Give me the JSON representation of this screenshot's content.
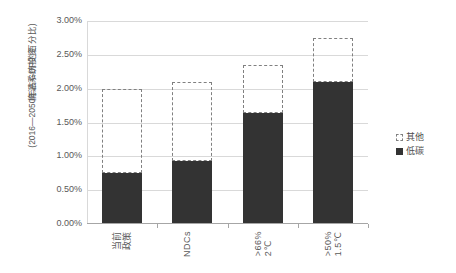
{
  "chart_data": {
    "type": "bar",
    "title": "",
    "subtitle": "",
    "xlabel": "",
    "ylabel_line1": "能源系统投资",
    "ylabel_line2": "(2016—2050年占GDP的百分比)",
    "categories": [
      "当前政策",
      "NDCs",
      ">66% 2℃",
      ">50% 1.5℃"
    ],
    "category_lines": [
      [
        "当前",
        "政策"
      ],
      [
        "NDCs"
      ],
      [
        ">66%",
        "2℃"
      ],
      [
        ">50%",
        "1.5℃"
      ]
    ],
    "series": [
      {
        "name": "低碳",
        "style": "solid",
        "color": "#333333",
        "values": [
          0.75,
          0.93,
          1.64,
          2.1
        ]
      },
      {
        "name": "其他",
        "style": "dashed",
        "color": "#808080",
        "values": [
          2.0,
          2.1,
          2.35,
          2.75
        ]
      }
    ],
    "ylim": [
      0,
      3.0
    ],
    "ytick_values": [
      0.0,
      0.5,
      1.0,
      1.5,
      2.0,
      2.5,
      3.0
    ],
    "ytick_labels": [
      "0.00%",
      "0.50%",
      "1.00%",
      "1.50%",
      "2.00%",
      "2.50%",
      "3.00%"
    ],
    "grid": true,
    "legend_position": "right",
    "legend_entries": [
      "其他",
      "低碳"
    ],
    "value_unit": "%"
  },
  "legend": {
    "other_label": "其他",
    "lowcarbon_label": "低碳"
  }
}
